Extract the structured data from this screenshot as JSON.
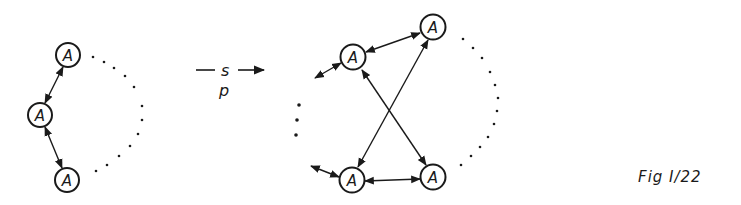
{
  "node_label": "A",
  "left_graph": {
    "nodes": [
      {
        "id": "L1",
        "label": "A",
        "x": 68,
        "y": 55
      },
      {
        "id": "L2",
        "label": "A",
        "x": 40,
        "y": 115
      },
      {
        "id": "L3",
        "label": "A",
        "x": 67,
        "y": 180
      }
    ],
    "edges": [
      {
        "from": "L1",
        "to": "L2",
        "type": "bidirectional"
      },
      {
        "from": "L2",
        "to": "L3",
        "type": "bidirectional"
      }
    ],
    "continuation": "dotted-arc"
  },
  "transform": {
    "top_label": "s",
    "bottom_label": "p",
    "arrow": "right"
  },
  "right_graph": {
    "nodes": [
      {
        "id": "R1",
        "label": "A",
        "x": 353,
        "y": 57
      },
      {
        "id": "R2",
        "label": "A",
        "x": 433,
        "y": 27
      },
      {
        "id": "R3",
        "label": "A",
        "x": 352,
        "y": 180
      },
      {
        "id": "R4",
        "label": "A",
        "x": 433,
        "y": 177
      }
    ],
    "edges": [
      {
        "from": "R1",
        "to": "R2",
        "type": "bidirectional"
      },
      {
        "from": "R3",
        "to": "R4",
        "type": "bidirectional"
      },
      {
        "from": "R1",
        "to": "R4",
        "type": "bidirectional"
      },
      {
        "from": "R2",
        "to": "R3",
        "type": "bidirectional"
      },
      {
        "from": "R1",
        "to": "outside",
        "type": "bidirectional"
      },
      {
        "from": "R3",
        "to": "outside",
        "type": "bidirectional"
      }
    ],
    "continuation": [
      "vertical-dots",
      "dotted-arc"
    ]
  },
  "caption": "Fig I/22"
}
